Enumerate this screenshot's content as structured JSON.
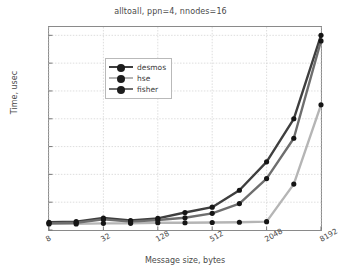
{
  "chart_data": {
    "type": "line",
    "title": "alltoall, ppn=4, nnodes=16",
    "xlabel": "Message size, bytes",
    "ylabel": "Time, usec",
    "xscale": "log2",
    "xlim": [
      8,
      8192
    ],
    "ylim": [
      0,
      730
    ],
    "grid": true,
    "legend_position": "upper left",
    "x": [
      8,
      16,
      32,
      64,
      128,
      256,
      512,
      1024,
      2048,
      4096,
      8192
    ],
    "xticks": [
      "8",
      "32",
      "128",
      "512",
      "2048",
      "8192"
    ],
    "xtick_values": [
      8,
      32,
      128,
      512,
      2048,
      8192
    ],
    "yticks": [
      "0",
      "100",
      "200",
      "300",
      "400",
      "500",
      "600",
      "700"
    ],
    "ytick_values": [
      0,
      100,
      200,
      300,
      400,
      500,
      600,
      700
    ],
    "series": [
      {
        "name": "desmos",
        "color": "#3f3f3f",
        "values": [
          28,
          30,
          43,
          34,
          42,
          63,
          82,
          143,
          245,
          400,
          700
        ]
      },
      {
        "name": "hse",
        "color": "#b5b5b5",
        "values": [
          22,
          22,
          24,
          24,
          26,
          26,
          27,
          28,
          30,
          165,
          450
        ]
      },
      {
        "name": "fisher",
        "color": "#6e6e6e",
        "values": [
          24,
          26,
          38,
          30,
          36,
          44,
          60,
          95,
          185,
          330,
          680
        ]
      }
    ]
  }
}
